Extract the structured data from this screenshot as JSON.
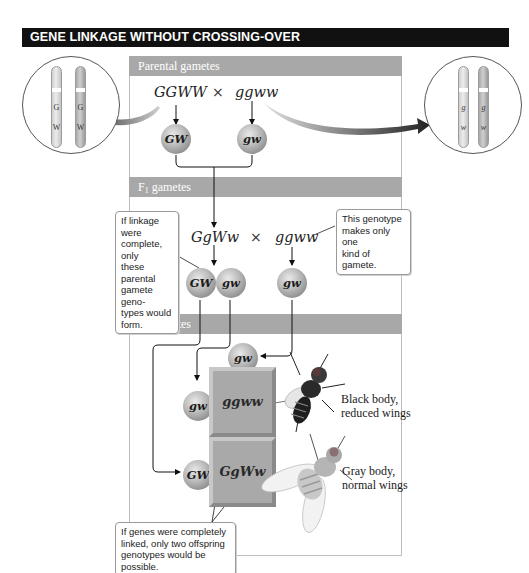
{
  "title": "GENE LINKAGE WITHOUT CROSSING-OVER",
  "sections": {
    "parental": {
      "label": "Parental gametes"
    },
    "f1": {
      "label_main": "F",
      "label_sub": "1",
      "label_rest": " gametes"
    },
    "f2": {
      "label_main": "F",
      "label_sub": "2",
      "label_rest": " gametes"
    }
  },
  "parental_cross": {
    "parent1": "GGWW",
    "cross_symbol": "×",
    "parent2": "ggww",
    "gamete1": "GW",
    "gamete2": "gw"
  },
  "f1_cross": {
    "parent1": "GgWw",
    "cross_symbol": "×",
    "parent2": "ggww",
    "gametes_parent1": [
      "GW",
      "gw"
    ],
    "gametes_parent2": [
      "gw"
    ]
  },
  "f2": {
    "column_gamete": "gw",
    "row_gametes": [
      "gw",
      "GW"
    ],
    "offspring": [
      {
        "genotype": "ggww",
        "phenotype_line1": "Black body,",
        "phenotype_line2": "reduced wings"
      },
      {
        "genotype": "GgWw",
        "phenotype_line1": "Gray body,",
        "phenotype_line2": "normal wings"
      }
    ]
  },
  "chromosome_insets": {
    "left": {
      "alleles_top": [
        "G",
        "G"
      ],
      "alleles_bottom": [
        "W",
        "W"
      ]
    },
    "right": {
      "alleles_top": [
        "g",
        "g"
      ],
      "alleles_bottom": [
        "w",
        "w"
      ]
    }
  },
  "notes": {
    "linkage_complete": "If linkage were complete, only these parental gamete geno-types would form.",
    "linkage_complete_lines": [
      "If linkage were",
      "complete, only",
      "these parental",
      "gamete geno-",
      "types would",
      "form."
    ],
    "one_gamete_lines": [
      "This genotype",
      "makes only one",
      "kind of gamete."
    ],
    "two_offspring_lines": [
      "If genes were completely",
      "linked, only two offspring",
      "genotypes would be possible."
    ]
  }
}
